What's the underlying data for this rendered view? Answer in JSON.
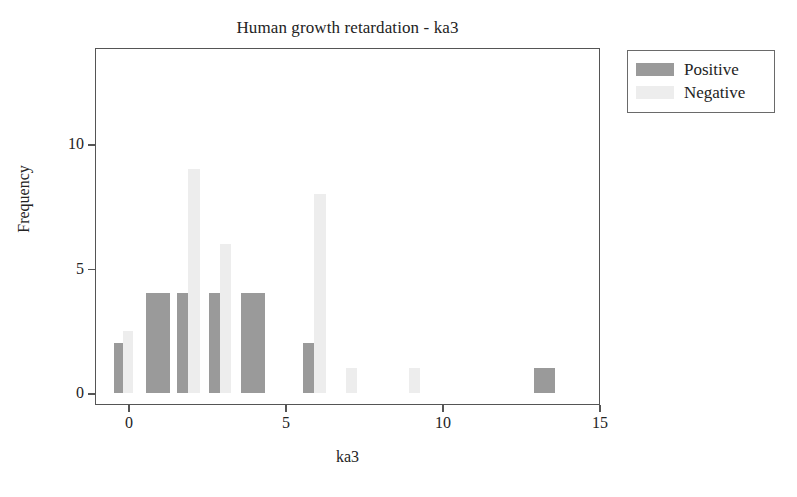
{
  "chart_data": {
    "type": "bar",
    "title": "Human growth retardation - ka3",
    "xlabel": "ka3",
    "ylabel": "Frequency",
    "xlim": [
      -0.8,
      15.2
    ],
    "ylim": [
      0,
      14.3
    ],
    "xticks": [
      0,
      5,
      10,
      15
    ],
    "yticks": [
      0,
      5,
      10
    ],
    "xtick_labels": [
      "0",
      "5",
      "10",
      "15"
    ],
    "ytick_labels": [
      "0",
      "5",
      "10"
    ],
    "grid": false,
    "legend_position": "upper right outside",
    "categories": [
      0,
      1,
      2,
      3,
      4,
      6,
      7,
      9,
      13
    ],
    "series": [
      {
        "name": "Positive",
        "color": "#9a9a9a",
        "values": [
          2,
          4,
          4,
          4,
          4,
          2,
          0,
          0,
          1
        ]
      },
      {
        "name": "Negative",
        "color": "#ededed",
        "values": [
          2.5,
          0,
          9,
          6,
          0,
          8,
          1,
          1,
          0
        ]
      }
    ],
    "bars": [
      {
        "x": 0,
        "series": "Positive",
        "value": 2,
        "px_left": 113,
        "px_width": 9
      },
      {
        "x": 0,
        "series": "Negative",
        "value": 2.5,
        "px_left": 122,
        "px_width": 10
      },
      {
        "x": 1,
        "series": "Positive",
        "value": 4,
        "px_left": 145,
        "px_width": 24
      },
      {
        "x": 2,
        "series": "Positive",
        "value": 4,
        "px_left": 176,
        "px_width": 11
      },
      {
        "x": 2,
        "series": "Negative",
        "value": 9,
        "px_left": 187,
        "px_width": 12
      },
      {
        "x": 3,
        "series": "Positive",
        "value": 4,
        "px_left": 208,
        "px_width": 11
      },
      {
        "x": 3,
        "series": "Negative",
        "value": 6,
        "px_left": 219,
        "px_width": 11
      },
      {
        "x": 4,
        "series": "Positive",
        "value": 4,
        "px_left": 240,
        "px_width": 24
      },
      {
        "x": 6,
        "series": "Positive",
        "value": 2,
        "px_left": 302,
        "px_width": 11
      },
      {
        "x": 6,
        "series": "Negative",
        "value": 8,
        "px_left": 313,
        "px_width": 12
      },
      {
        "x": 7,
        "series": "Negative",
        "value": 1,
        "px_left": 345,
        "px_width": 11
      },
      {
        "x": 9,
        "series": "Negative",
        "value": 1,
        "px_left": 408,
        "px_width": 11
      },
      {
        "x": 13,
        "series": "Positive",
        "value": 1,
        "px_left": 533,
        "px_width": 21
      }
    ]
  },
  "legend": {
    "items": [
      {
        "label": "Positive",
        "swatch": "positive"
      },
      {
        "label": "Negative",
        "swatch": "negative"
      }
    ]
  }
}
